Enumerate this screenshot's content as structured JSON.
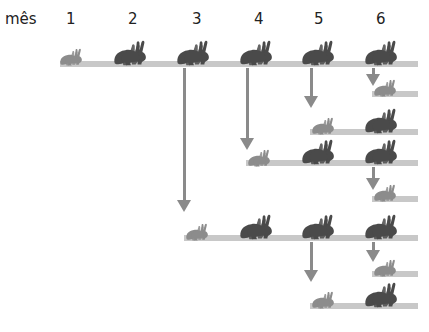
{
  "header": {
    "axis_label": "mês",
    "months": [
      "1",
      "2",
      "3",
      "4",
      "5",
      "6"
    ]
  },
  "colors": {
    "bar": "#c8c8c8",
    "arrow": "#8a8a8a",
    "adult_rabbit": "#4a4a4a",
    "young_rabbit": "#8c8c8c"
  },
  "legend": {
    "adult": "adult-pair",
    "young": "young-pair"
  },
  "pair_counts_by_month": [
    1,
    1,
    2,
    3,
    5,
    8
  ]
}
